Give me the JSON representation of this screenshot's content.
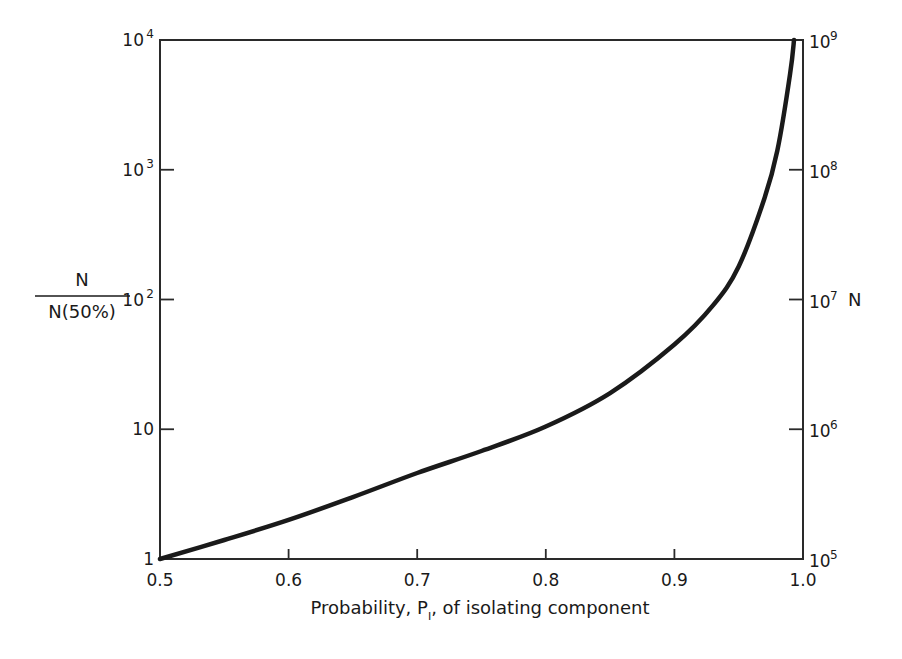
{
  "chart_data": {
    "type": "line",
    "title": "",
    "xlabel": "Probability, P1, of isolating component",
    "xlabel_parts": {
      "before": "Probability, P",
      "subscript": "I",
      "after": ", of isolating component"
    },
    "ylabel_left": {
      "numerator": "N",
      "denominator": "N(50%)"
    },
    "ylabel_right": "N",
    "xlim": [
      0.5,
      1.0
    ],
    "ylim_left": [
      1,
      10000
    ],
    "ylim_right": [
      100000,
      1000000000
    ],
    "yscale": "log",
    "grid": false,
    "x_ticks": [
      "0.5",
      "0.6",
      "0.7",
      "0.8",
      "0.9",
      "1.0"
    ],
    "x_tick_values": [
      0.5,
      0.6,
      0.7,
      0.8,
      0.9,
      1.0
    ],
    "y_ticks_left": [
      {
        "value": 1,
        "base": "1",
        "exp": ""
      },
      {
        "value": 10,
        "base": "10",
        "exp": ""
      },
      {
        "value": 100,
        "base": "10",
        "exp": "2"
      },
      {
        "value": 1000,
        "base": "10",
        "exp": "3"
      },
      {
        "value": 10000,
        "base": "10",
        "exp": "4"
      }
    ],
    "y_ticks_right": [
      {
        "value": 100000,
        "base": "10",
        "exp": "5"
      },
      {
        "value": 1000000,
        "base": "10",
        "exp": "6"
      },
      {
        "value": 10000000,
        "base": "10",
        "exp": "7"
      },
      {
        "value": 100000000,
        "base": "10",
        "exp": "8"
      },
      {
        "value": 1000000000,
        "base": "10",
        "exp": "9"
      }
    ],
    "series": [
      {
        "name": "N / N(50%)",
        "x": [
          0.5,
          0.55,
          0.6,
          0.65,
          0.7,
          0.75,
          0.8,
          0.85,
          0.9,
          0.93,
          0.95,
          0.97,
          0.98,
          0.99,
          0.993
        ],
        "y": [
          1.0,
          1.4,
          2.0,
          3.0,
          4.6,
          6.8,
          10.5,
          19,
          45,
          90,
          180,
          600,
          1400,
          5500,
          10000
        ]
      }
    ]
  },
  "colors": {
    "line": "#1a1a1a",
    "axis": "#2a2a2a",
    "background": "#ffffff"
  }
}
